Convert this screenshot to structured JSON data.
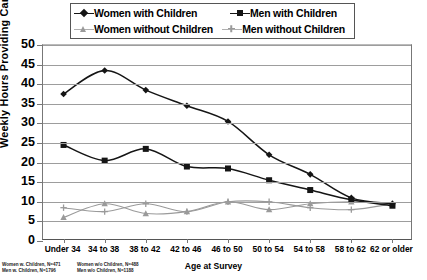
{
  "legend": {
    "items": [
      {
        "label": "Women with Children",
        "marker": "diamond-marker-icon",
        "color": "#151515"
      },
      {
        "label": "Men with Children",
        "marker": "square-marker-icon",
        "color": "#151515"
      },
      {
        "label": "Women without Children",
        "marker": "triangle-marker-icon",
        "color": "#9a9a9a"
      },
      {
        "label": "Men without Children",
        "marker": "cross-marker-icon",
        "color": "#9a9a9a"
      }
    ]
  },
  "notes": {
    "left": [
      "Women w. Children, N=471",
      "Men w. Children, N=1796"
    ],
    "right": [
      "Women w/o Children, N=488",
      "Men w/o Children, N=1188"
    ]
  },
  "chart_data": {
    "type": "line",
    "title": "",
    "xlabel": "Age at Survey",
    "ylabel": "Weekly Hours Providing Care",
    "ylim": [
      0,
      50
    ],
    "ytick_step": 5,
    "yticks": [
      0,
      5,
      10,
      15,
      20,
      25,
      30,
      35,
      40,
      45,
      50
    ],
    "grid": true,
    "legend_position": "top",
    "categories": [
      "Under 34",
      "34 to 38",
      "38 to 42",
      "42 to 46",
      "46 to 50",
      "50 to 54",
      "54 to 58",
      "58 to 62",
      "62 or older"
    ],
    "series": [
      {
        "name": "Women with Children",
        "marker": "diamond",
        "color": "#151515",
        "values": [
          37.5,
          43.5,
          38.5,
          34.5,
          30.5,
          22.0,
          17.0,
          11.0,
          9.5
        ]
      },
      {
        "name": "Men with Children",
        "marker": "square",
        "color": "#151515",
        "values": [
          24.5,
          20.5,
          23.5,
          19.0,
          18.5,
          15.5,
          13.0,
          10.5,
          9.0
        ]
      },
      {
        "name": "Women without Children",
        "marker": "triangle",
        "color": "#9a9a9a",
        "values": [
          6.0,
          9.5,
          7.0,
          7.5,
          10.0,
          8.0,
          9.5,
          10.0,
          9.5
        ]
      },
      {
        "name": "Men without Children",
        "marker": "cross",
        "color": "#9a9a9a",
        "values": [
          8.5,
          7.5,
          9.5,
          7.5,
          10.0,
          10.0,
          8.5,
          8.0,
          9.5
        ]
      }
    ]
  }
}
